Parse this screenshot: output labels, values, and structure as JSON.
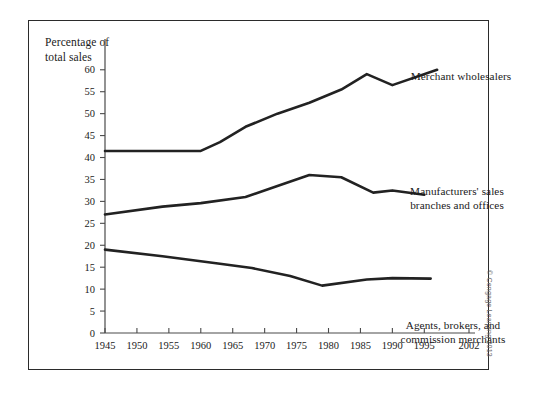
{
  "figure": {
    "axis_title": "Percentage of\ntotal sales",
    "credit": "© Cengage Learning 2013"
  },
  "chart_data": {
    "type": "line",
    "title": "",
    "subtitle": "",
    "xlabel": "",
    "ylabel": "Percentage of total sales",
    "xlim": [
      1945,
      2002
    ],
    "ylim": [
      0,
      62
    ],
    "yticks": [
      0,
      5,
      10,
      15,
      20,
      25,
      30,
      35,
      40,
      45,
      50,
      55,
      60
    ],
    "xticks": [
      1945,
      1950,
      1955,
      1960,
      1965,
      1970,
      1975,
      1980,
      1985,
      1990,
      1995,
      2002
    ],
    "xtick_labels": [
      "1945",
      "1950",
      "1955",
      "1960",
      "1965",
      "1970",
      "1975",
      "1980",
      "1985",
      "1990",
      "1995",
      "2002"
    ],
    "ytick_labels": [
      "0",
      "5",
      "10",
      "15",
      "20",
      "25",
      "30",
      "35",
      "40",
      "45",
      "50",
      "55",
      "60"
    ],
    "grid": false,
    "legend": "inline-annotations",
    "series": [
      {
        "name": "Merchant wholesalers",
        "label_text": "Merchant wholesalers",
        "color": "#222222",
        "x": [
          1945,
          1954,
          1960,
          1963,
          1967,
          1972,
          1977,
          1982,
          1986,
          1990,
          1997
        ],
        "values": [
          41.5,
          41.5,
          41.5,
          43.5,
          47.0,
          50.0,
          52.5,
          55.5,
          59.0,
          56.5,
          60.0
        ]
      },
      {
        "name": "Manufacturers' sales branches and offices",
        "label_text": "Manufacturers' sales\nbranches and offices",
        "color": "#222222",
        "x": [
          1945,
          1954,
          1960,
          1967,
          1972,
          1977,
          1982,
          1987,
          1990,
          1995
        ],
        "values": [
          27.0,
          28.8,
          29.6,
          31.0,
          33.5,
          36.0,
          35.5,
          32.0,
          32.5,
          31.5
        ]
      },
      {
        "name": "Agents, brokers, and commission merchants",
        "label_text": "Agents, brokers, and\ncommission merchants",
        "color": "#222222",
        "x": [
          1945,
          1954,
          1963,
          1968,
          1974,
          1979,
          1986,
          1990,
          1996
        ],
        "values": [
          19.0,
          17.5,
          15.8,
          14.8,
          13.0,
          10.8,
          12.2,
          12.5,
          12.4
        ]
      }
    ]
  }
}
